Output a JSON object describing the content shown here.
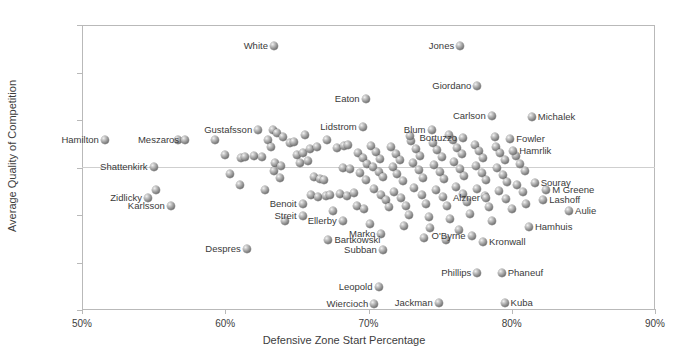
{
  "chart_data": {
    "type": "scatter",
    "title": "",
    "xlabel": "Defensive Zone Start Percentage",
    "ylabel": "Average Quality of Competition",
    "xlim": [
      50,
      90
    ],
    "ylim": [
      -15,
      15
    ],
    "xticks": [
      50,
      60,
      70,
      80,
      90
    ],
    "xtick_labels": [
      "50%",
      "60%",
      "70%",
      "80%",
      "90%"
    ],
    "yticks": [
      -15,
      -10,
      -5,
      0,
      5,
      10,
      15
    ],
    "ytick_labels": [
      "-15",
      "-10",
      "-5",
      "0",
      "5",
      "10",
      "15"
    ],
    "grid": false,
    "legend": false,
    "marker_style": "3d-sphere-gray",
    "series_name": "NHL Defensemen",
    "labeled_points": [
      {
        "name": "Hamilton",
        "x": 51.6,
        "y": 2.9,
        "side": "right"
      },
      {
        "name": "Shattenkirk",
        "x": 55.0,
        "y": 0.1,
        "side": "right"
      },
      {
        "name": "Zidlicky",
        "x": 54.6,
        "y": -3.2,
        "side": "right"
      },
      {
        "name": "Karlsson",
        "x": 56.2,
        "y": -4.0,
        "side": "right"
      },
      {
        "name": "Meszaros",
        "x": 57.2,
        "y": 2.9,
        "side": "right"
      },
      {
        "name": "Gustafsson",
        "x": 62.3,
        "y": 3.9,
        "side": "right"
      },
      {
        "name": "Despres",
        "x": 61.5,
        "y": -8.6,
        "side": "right"
      },
      {
        "name": "Benoit",
        "x": 65.4,
        "y": -3.8,
        "side": "right"
      },
      {
        "name": "Streit",
        "x": 65.4,
        "y": -5.1,
        "side": "right"
      },
      {
        "name": "Ellerby",
        "x": 68.2,
        "y": -5.6,
        "side": "right"
      },
      {
        "name": "Bartkowski",
        "x": 67.2,
        "y": -7.6,
        "side": "left"
      },
      {
        "name": "White",
        "x": 63.4,
        "y": 12.8,
        "side": "right"
      },
      {
        "name": "Eaton",
        "x": 69.8,
        "y": 7.2,
        "side": "right"
      },
      {
        "name": "Lidstrom",
        "x": 69.6,
        "y": 4.3,
        "side": "right"
      },
      {
        "name": "Marko",
        "x": 70.9,
        "y": -7.0,
        "side": "right"
      },
      {
        "name": "Subban",
        "x": 71.0,
        "y": -8.7,
        "side": "right"
      },
      {
        "name": "Leopold",
        "x": 70.7,
        "y": -12.6,
        "side": "right"
      },
      {
        "name": "Wiercioch",
        "x": 70.4,
        "y": -14.4,
        "side": "right"
      },
      {
        "name": "Jackman",
        "x": 74.9,
        "y": -14.3,
        "side": "right"
      },
      {
        "name": "Jones",
        "x": 76.4,
        "y": 12.8,
        "side": "right"
      },
      {
        "name": "Giordano",
        "x": 77.6,
        "y": 8.6,
        "side": "right"
      },
      {
        "name": "Blum",
        "x": 74.4,
        "y": 3.9,
        "side": "right"
      },
      {
        "name": "Carlson",
        "x": 78.6,
        "y": 5.4,
        "side": "right"
      },
      {
        "name": "Michalek",
        "x": 81.4,
        "y": 5.3,
        "side": "left"
      },
      {
        "name": "Bortuzzo",
        "x": 76.6,
        "y": 3.1,
        "side": "right"
      },
      {
        "name": "Fowler",
        "x": 79.9,
        "y": 3.0,
        "side": "left"
      },
      {
        "name": "Hamrlik",
        "x": 80.1,
        "y": 1.7,
        "side": "left"
      },
      {
        "name": "O'Byrne",
        "x": 77.2,
        "y": -7.2,
        "side": "right"
      },
      {
        "name": "Kronwall",
        "x": 78.0,
        "y": -7.8,
        "side": "left"
      },
      {
        "name": "Alzner",
        "x": 78.2,
        "y": -3.2,
        "side": "right"
      },
      {
        "name": "Souray",
        "x": 81.6,
        "y": -1.6,
        "side": "left"
      },
      {
        "name": "M Greene",
        "x": 82.4,
        "y": -2.4,
        "side": "left"
      },
      {
        "name": "Lashoff",
        "x": 82.2,
        "y": -3.4,
        "side": "left"
      },
      {
        "name": "Aulie",
        "x": 84.0,
        "y": -4.6,
        "side": "left"
      },
      {
        "name": "Hamhuis",
        "x": 81.2,
        "y": -6.3,
        "side": "left"
      },
      {
        "name": "Phillips",
        "x": 77.6,
        "y": -11.1,
        "side": "right"
      },
      {
        "name": "Phaneuf",
        "x": 79.3,
        "y": -11.1,
        "side": "left"
      },
      {
        "name": "Kuba",
        "x": 79.5,
        "y": -14.3,
        "side": "left"
      }
    ],
    "unlabeled_points": [
      {
        "x": 56.7,
        "y": 2.9
      },
      {
        "x": 55.2,
        "y": -2.4
      },
      {
        "x": 60.0,
        "y": 1.3
      },
      {
        "x": 60.3,
        "y": -0.7
      },
      {
        "x": 61.1,
        "y": 1.0
      },
      {
        "x": 61.4,
        "y": 1.1
      },
      {
        "x": 62.0,
        "y": 1.2
      },
      {
        "x": 62.6,
        "y": 1.1
      },
      {
        "x": 61.0,
        "y": -1.8
      },
      {
        "x": 63.0,
        "y": 2.9
      },
      {
        "x": 63.3,
        "y": 3.9
      },
      {
        "x": 63.6,
        "y": 3.6
      },
      {
        "x": 63.2,
        "y": 2.2
      },
      {
        "x": 63.5,
        "y": 0.5
      },
      {
        "x": 63.9,
        "y": 0.2
      },
      {
        "x": 63.4,
        "y": -0.4
      },
      {
        "x": 63.8,
        "y": -1.1
      },
      {
        "x": 64.5,
        "y": 2.6
      },
      {
        "x": 64.8,
        "y": 2.7
      },
      {
        "x": 65.0,
        "y": 1.3
      },
      {
        "x": 65.4,
        "y": 1.5
      },
      {
        "x": 65.2,
        "y": 0.5
      },
      {
        "x": 65.8,
        "y": 0.7
      },
      {
        "x": 65.9,
        "y": 2.0
      },
      {
        "x": 66.4,
        "y": 2.2
      },
      {
        "x": 66.2,
        "y": -1.0
      },
      {
        "x": 66.6,
        "y": -1.2
      },
      {
        "x": 66.9,
        "y": -1.3
      },
      {
        "x": 66.0,
        "y": -2.9
      },
      {
        "x": 66.5,
        "y": -3.1
      },
      {
        "x": 67.0,
        "y": -3.0
      },
      {
        "x": 67.3,
        "y": -2.9
      },
      {
        "x": 67.8,
        "y": 2.1
      },
      {
        "x": 68.3,
        "y": 2.3
      },
      {
        "x": 68.6,
        "y": 2.4
      },
      {
        "x": 68.2,
        "y": 0.0
      },
      {
        "x": 68.7,
        "y": -0.2
      },
      {
        "x": 68.0,
        "y": -2.8
      },
      {
        "x": 68.5,
        "y": -3.0
      },
      {
        "x": 69.0,
        "y": -2.7
      },
      {
        "x": 69.3,
        "y": 1.5
      },
      {
        "x": 69.6,
        "y": 1.0
      },
      {
        "x": 69.9,
        "y": 0.4
      },
      {
        "x": 69.4,
        "y": -0.6
      },
      {
        "x": 69.8,
        "y": -1.3
      },
      {
        "x": 69.2,
        "y": -4.0
      },
      {
        "x": 69.7,
        "y": -4.4
      },
      {
        "x": 70.2,
        "y": 2.3
      },
      {
        "x": 70.5,
        "y": 1.6
      },
      {
        "x": 70.8,
        "y": 0.9
      },
      {
        "x": 70.3,
        "y": 0.1
      },
      {
        "x": 70.7,
        "y": -0.5
      },
      {
        "x": 71.0,
        "y": -1.0
      },
      {
        "x": 70.4,
        "y": -2.3
      },
      {
        "x": 70.9,
        "y": -2.9
      },
      {
        "x": 71.2,
        "y": -3.4
      },
      {
        "x": 71.4,
        "y": -4.2
      },
      {
        "x": 71.6,
        "y": 2.2
      },
      {
        "x": 71.9,
        "y": 1.4
      },
      {
        "x": 72.2,
        "y": 0.8
      },
      {
        "x": 71.7,
        "y": 0.1
      },
      {
        "x": 72.0,
        "y": -0.7
      },
      {
        "x": 72.4,
        "y": -1.4
      },
      {
        "x": 71.8,
        "y": -2.6
      },
      {
        "x": 72.3,
        "y": -3.2
      },
      {
        "x": 72.6,
        "y": -4.0
      },
      {
        "x": 72.8,
        "y": -5.0
      },
      {
        "x": 73.0,
        "y": 2.8
      },
      {
        "x": 73.3,
        "y": 2.0
      },
      {
        "x": 73.6,
        "y": 1.2
      },
      {
        "x": 73.1,
        "y": 0.5
      },
      {
        "x": 73.5,
        "y": -0.3
      },
      {
        "x": 73.8,
        "y": -1.1
      },
      {
        "x": 73.2,
        "y": -2.2
      },
      {
        "x": 73.7,
        "y": -2.9
      },
      {
        "x": 74.0,
        "y": -3.8
      },
      {
        "x": 74.2,
        "y": -5.2
      },
      {
        "x": 74.5,
        "y": 2.6
      },
      {
        "x": 74.8,
        "y": 1.8
      },
      {
        "x": 75.1,
        "y": 1.1
      },
      {
        "x": 74.6,
        "y": 0.3
      },
      {
        "x": 75.0,
        "y": -0.5
      },
      {
        "x": 75.3,
        "y": -1.2
      },
      {
        "x": 74.7,
        "y": -2.4
      },
      {
        "x": 75.2,
        "y": -3.1
      },
      {
        "x": 75.5,
        "y": -4.1
      },
      {
        "x": 75.7,
        "y": -5.4
      },
      {
        "x": 75.9,
        "y": 2.9
      },
      {
        "x": 76.2,
        "y": 2.1
      },
      {
        "x": 76.5,
        "y": 1.4
      },
      {
        "x": 76.0,
        "y": 0.6
      },
      {
        "x": 76.4,
        "y": -0.2
      },
      {
        "x": 76.7,
        "y": -0.9
      },
      {
        "x": 76.1,
        "y": -2.1
      },
      {
        "x": 76.6,
        "y": -2.8
      },
      {
        "x": 76.9,
        "y": -3.6
      },
      {
        "x": 77.1,
        "y": -4.9
      },
      {
        "x": 77.4,
        "y": 2.4
      },
      {
        "x": 77.7,
        "y": 1.7
      },
      {
        "x": 78.0,
        "y": 1.0
      },
      {
        "x": 77.5,
        "y": 0.2
      },
      {
        "x": 77.9,
        "y": -0.6
      },
      {
        "x": 78.2,
        "y": -1.3
      },
      {
        "x": 77.6,
        "y": -2.3
      },
      {
        "x": 78.1,
        "y": -3.0
      },
      {
        "x": 78.4,
        "y": -4.2
      },
      {
        "x": 78.6,
        "y": -5.6
      },
      {
        "x": 78.9,
        "y": 2.2
      },
      {
        "x": 79.2,
        "y": 1.5
      },
      {
        "x": 79.5,
        "y": 0.8
      },
      {
        "x": 79.0,
        "y": 0.0
      },
      {
        "x": 79.4,
        "y": -0.8
      },
      {
        "x": 79.7,
        "y": -1.5
      },
      {
        "x": 79.1,
        "y": -2.5
      },
      {
        "x": 79.6,
        "y": -3.3
      },
      {
        "x": 80.0,
        "y": -4.4
      },
      {
        "x": 80.3,
        "y": 1.2
      },
      {
        "x": 80.6,
        "y": 0.4
      },
      {
        "x": 80.9,
        "y": -0.4
      },
      {
        "x": 80.4,
        "y": -1.8
      },
      {
        "x": 80.8,
        "y": -2.6
      },
      {
        "x": 81.0,
        "y": -3.8
      },
      {
        "x": 64.2,
        "y": -5.6
      },
      {
        "x": 67.5,
        "y": -4.6
      },
      {
        "x": 62.8,
        "y": -2.4
      },
      {
        "x": 59.3,
        "y": 2.9
      },
      {
        "x": 64.0,
        "y": 3.2
      },
      {
        "x": 65.6,
        "y": 3.4
      },
      {
        "x": 67.1,
        "y": 2.9
      },
      {
        "x": 72.9,
        "y": 3.3
      },
      {
        "x": 75.6,
        "y": 3.4
      },
      {
        "x": 78.8,
        "y": 3.2
      },
      {
        "x": 74.3,
        "y": -6.4
      },
      {
        "x": 76.3,
        "y": -6.6
      },
      {
        "x": 72.5,
        "y": -6.2
      },
      {
        "x": 70.1,
        "y": -5.9
      },
      {
        "x": 73.9,
        "y": -7.4
      },
      {
        "x": 75.4,
        "y": -7.6
      }
    ]
  },
  "axes": {
    "x_title": "Defensive Zone Start Percentage",
    "y_title": "Average Quality of Competition"
  }
}
